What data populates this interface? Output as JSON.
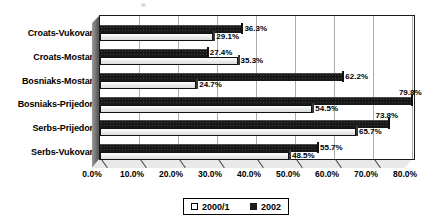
{
  "chart_data": {
    "type": "bar",
    "orientation": "horizontal",
    "style": "excel-3d-horizontal-grouped-bar",
    "title": "",
    "categories": [
      "Croats-Vukovar",
      "Croats-Mostar",
      "Bosniaks-Mostar",
      "Bosniaks-Prijedor",
      "Serbs-Prijedor",
      "Serbs-Vukovar"
    ],
    "series": [
      {
        "name": "2000/1",
        "fill": "#ffffff",
        "values": [
          29.1,
          35.3,
          24.7,
          54.5,
          65.7,
          48.5
        ],
        "labels": [
          "29.1%",
          "35.3%",
          "24.7%",
          "54.5%",
          "65.7%",
          "48.5%"
        ]
      },
      {
        "name": "2002",
        "fill": "#181818",
        "values": [
          36.3,
          27.4,
          62.2,
          79.8,
          73.8,
          55.7
        ],
        "labels": [
          "36.3%",
          "27.4%",
          "62.2%",
          "79.8%",
          "73.8%",
          "55.7%"
        ]
      }
    ],
    "x_axis": {
      "min": 0,
      "max": 80,
      "plot_max": 80.6,
      "tick_step": 10,
      "tick_labels": [
        "0.0%",
        "10.0%",
        "20.0%",
        "30.0%",
        "40.0%",
        "50.0%",
        "60.0%",
        "70.0%",
        "80.0%"
      ]
    },
    "grid": true,
    "legend_position": "bottom",
    "colors": {
      "series_2002": "#181818",
      "series_2000_1": "#ffffff",
      "gridline": "#ababab",
      "wall": "#6f6f6f",
      "floor": "#e9e9e9",
      "plot_border": "#1b1b1b"
    }
  }
}
